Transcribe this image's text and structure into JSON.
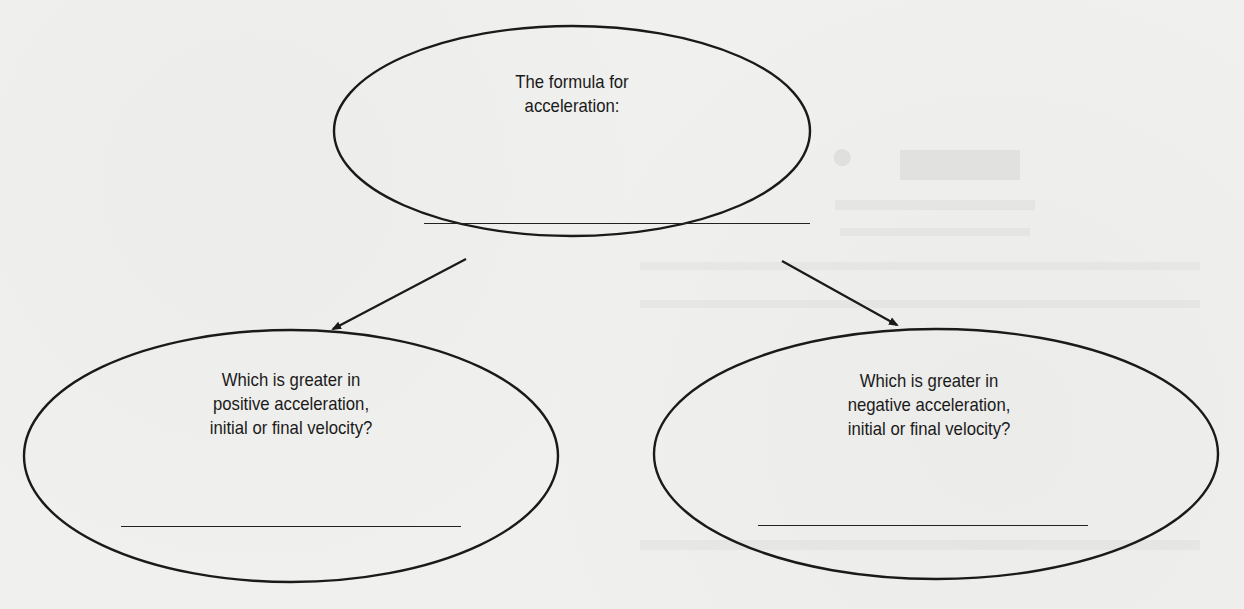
{
  "concept_map": {
    "top_node": {
      "text_line1": "The formula for",
      "text_line2": "acceleration:",
      "answer_blank": ""
    },
    "left_node": {
      "text_line1": "Which is greater in",
      "text_line2": "positive acceleration,",
      "text_line3": "initial or final velocity?",
      "answer_blank": ""
    },
    "right_node": {
      "text_line1": "Which is greater in",
      "text_line2": "negative acceleration,",
      "text_line3": "initial or final velocity?",
      "answer_blank": ""
    }
  },
  "colors": {
    "ink": "#1a1a1a",
    "paper": "#f0f0ee"
  }
}
